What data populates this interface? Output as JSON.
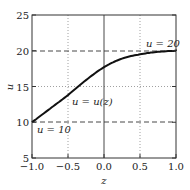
{
  "chart_data": {
    "type": "line",
    "title": "",
    "xlabel": "z",
    "ylabel": "u",
    "xlim": [
      -1.0,
      1.0
    ],
    "ylim": [
      5,
      25
    ],
    "xticks": [
      "-1.0",
      "-0.5",
      "0.0",
      "0.5",
      "1.0"
    ],
    "yticks": [
      "5",
      "10",
      "15",
      "20",
      "25"
    ],
    "grid": "dotted at x=-0.5, x=0.5, y=15",
    "series": [
      {
        "name": "u = u(z)",
        "x": [
          -1.0,
          -0.75,
          -0.5,
          -0.25,
          0.0,
          0.25,
          0.5,
          0.75,
          1.0
        ],
        "values": [
          10.0,
          11.9,
          13.8,
          15.9,
          17.7,
          18.9,
          19.5,
          19.85,
          20.0
        ]
      }
    ],
    "reference_lines": [
      {
        "label": "u = 20",
        "y": 20,
        "style": "dashed"
      },
      {
        "label": "u = 10",
        "y": 10,
        "style": "dashed"
      },
      {
        "x": 0.0,
        "style": "solid"
      }
    ],
    "annotations": [
      {
        "text": "u = 20",
        "x": 0.75,
        "y": 20.8
      },
      {
        "text": "u = u(z)",
        "x": -0.45,
        "y": 13.0
      },
      {
        "text": "u = 10",
        "x": -0.9,
        "y": 9.0
      }
    ]
  }
}
